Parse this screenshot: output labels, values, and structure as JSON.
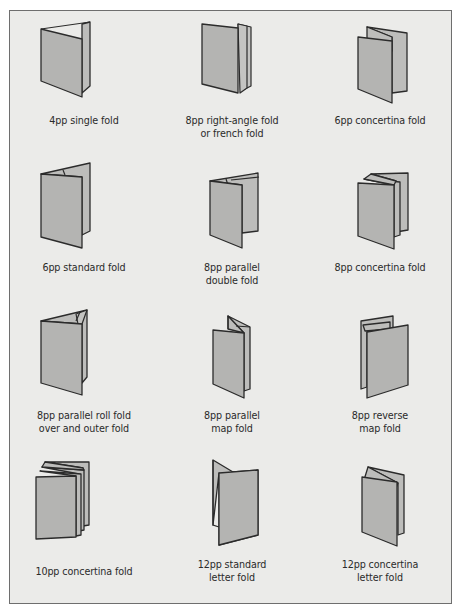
{
  "colors": {
    "background": "#ebebe9",
    "panel_fill": "#b4b4b2",
    "outline": "#2b2b2b",
    "label_text": "#2a2a2a",
    "border": "#6e6e6e"
  },
  "folds": [
    {
      "id": "4pp-single",
      "icon": "single-fold-icon",
      "pages": "4pp",
      "label_lines": [
        "4pp single fold"
      ]
    },
    {
      "id": "8pp-right-angle",
      "icon": "right-angle-fold-icon",
      "pages": "8pp",
      "label_lines": [
        "8pp right-angle fold",
        "or french fold"
      ]
    },
    {
      "id": "6pp-concertina",
      "icon": "concertina-fold-icon",
      "pages": "6pp",
      "label_lines": [
        "6pp concertina fold"
      ]
    },
    {
      "id": "6pp-standard",
      "icon": "standard-fold-icon",
      "pages": "6pp",
      "label_lines": [
        "6pp standard fold"
      ]
    },
    {
      "id": "8pp-parallel-double",
      "icon": "parallel-double-fold-icon",
      "pages": "8pp",
      "label_lines": [
        "8pp parallel",
        "double fold"
      ]
    },
    {
      "id": "8pp-concertina",
      "icon": "concertina-fold-icon",
      "pages": "8pp",
      "label_lines": [
        "8pp concertina fold"
      ]
    },
    {
      "id": "8pp-parallel-roll",
      "icon": "roll-fold-icon",
      "pages": "8pp",
      "label_lines": [
        "8pp parallel roll  fold",
        "over and outer fold"
      ]
    },
    {
      "id": "8pp-parallel-map",
      "icon": "parallel-map-fold-icon",
      "pages": "8pp",
      "label_lines": [
        "8pp parallel",
        "map fold"
      ]
    },
    {
      "id": "8pp-reverse-map",
      "icon": "reverse-map-fold-icon",
      "pages": "8pp",
      "label_lines": [
        "8pp reverse",
        "map fold"
      ]
    },
    {
      "id": "10pp-concertina",
      "icon": "concertina-fold-icon",
      "pages": "10pp",
      "label_lines": [
        "10pp concertina fold"
      ]
    },
    {
      "id": "12pp-standard-letter",
      "icon": "standard-letter-fold-icon",
      "pages": "12pp",
      "label_lines": [
        "12pp standard",
        "letter fold"
      ]
    },
    {
      "id": "12pp-concertina-letter",
      "icon": "concertina-letter-fold-icon",
      "pages": "12pp",
      "label_lines": [
        "12pp concertina",
        "letter fold"
      ]
    }
  ]
}
